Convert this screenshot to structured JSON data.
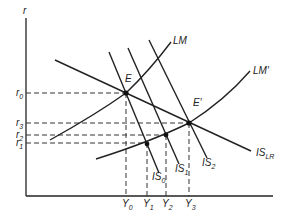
{
  "diagram": {
    "axes": {
      "y_label": "r"
    },
    "curves": {
      "lm": "LM",
      "lm_prime": "LM′",
      "is0": "IS",
      "is0_sub": "0",
      "is1": "IS",
      "is1_sub": "1",
      "is2": "IS",
      "is2_sub": "2",
      "islr": "IS",
      "islr_sub": "LR"
    },
    "points": {
      "e": "E",
      "e_prime": "E′"
    },
    "r_ticks": [
      {
        "base": "r",
        "sub": "0"
      },
      {
        "base": "r",
        "sub": "3"
      },
      {
        "base": "r",
        "sub": "2"
      },
      {
        "base": "r",
        "sub": "1"
      }
    ],
    "y_ticks": [
      {
        "base": "Y",
        "sub": "0"
      },
      {
        "base": "Y",
        "sub": "1"
      },
      {
        "base": "Y",
        "sub": "2"
      },
      {
        "base": "Y",
        "sub": "3"
      }
    ]
  }
}
